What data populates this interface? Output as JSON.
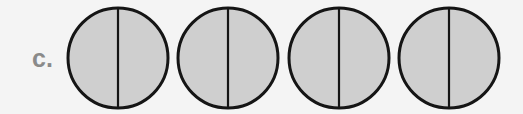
{
  "figure": {
    "label": "c.",
    "label_color": "#8a8a8a",
    "background": "#f4f4f4",
    "shapes": [
      {
        "shape": "circle",
        "parts": 2,
        "shaded_parts": 2,
        "cx": 118,
        "cy": 58,
        "r": 50
      },
      {
        "shape": "circle",
        "parts": 2,
        "shaded_parts": 2,
        "cx": 228,
        "cy": 58,
        "r": 50
      },
      {
        "shape": "circle",
        "parts": 2,
        "shaded_parts": 2,
        "cx": 339,
        "cy": 58,
        "r": 50
      },
      {
        "shape": "circle",
        "parts": 2,
        "shaded_parts": 2,
        "cx": 449,
        "cy": 58,
        "r": 50
      }
    ],
    "fill_color": "#cfcfcf",
    "stroke_color": "#151515",
    "stroke_width": 3,
    "divider_width": 2.2
  }
}
